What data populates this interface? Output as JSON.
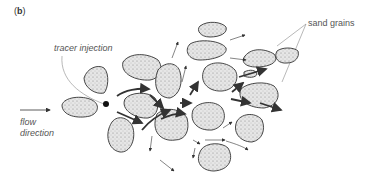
{
  "figure": {
    "panel_label": "b",
    "labels": {
      "tracer_injection": "tracer injection",
      "sand_grains": "sand grains",
      "flow_direction_line1": "flow",
      "flow_direction_line2": "direction"
    },
    "colors": {
      "grain_fill": "#dcdcdc",
      "grain_stroke": "#333333",
      "arrow": "#333333",
      "leader_line": "#888888",
      "text": "#555555"
    }
  }
}
